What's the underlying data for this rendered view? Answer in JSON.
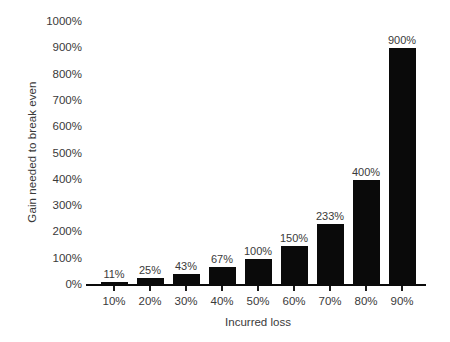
{
  "chart_data": {
    "type": "bar",
    "title": "",
    "xlabel": "Incurred loss",
    "ylabel": "Gain needed to break even",
    "categories": [
      "10%",
      "20%",
      "30%",
      "40%",
      "50%",
      "60%",
      "70%",
      "80%",
      "90%"
    ],
    "values": [
      11,
      25,
      43,
      67,
      100,
      150,
      233,
      400,
      900
    ],
    "value_labels": [
      "11%",
      "25%",
      "43%",
      "67%",
      "100%",
      "150%",
      "233%",
      "400%",
      "900%"
    ],
    "ylim": [
      0,
      1000
    ],
    "y_tick_labels": [
      "1000%",
      "900%",
      "800%",
      "700%",
      "600%",
      "500%",
      "400%",
      "300%",
      "200%",
      "100%",
      "0%"
    ],
    "y_tick_values": [
      1000,
      900,
      800,
      700,
      600,
      500,
      400,
      300,
      200,
      100,
      0
    ],
    "grid": false,
    "legend": false,
    "legend_position": "none",
    "bar_color": "#0a0a0a",
    "text_color": "#3a3a3a",
    "background_color": "#ffffff"
  }
}
